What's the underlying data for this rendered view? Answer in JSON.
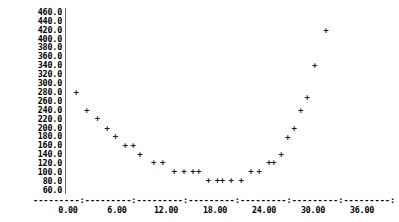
{
  "chart_data": {
    "type": "scatter",
    "title": "",
    "subtitle": "",
    "xlabel": "",
    "ylabel": "",
    "xlim": [
      -1.5,
      37.5
    ],
    "ylim": [
      55.0,
      465.0
    ],
    "grid": false,
    "legend": null,
    "marker": "+",
    "marker_color": "#1a1a1a",
    "y_ticks": [
      460.0,
      440.0,
      420.0,
      400.0,
      380.0,
      360.0,
      340.0,
      320.0,
      300.0,
      280.0,
      260.0,
      240.0,
      220.0,
      200.0,
      180.0,
      160.0,
      140.0,
      120.0,
      100.0,
      80.0,
      60.0
    ],
    "y_tick_labels": [
      "460.0",
      "440.0",
      "420.0",
      "400.0",
      "380.0",
      "360.0",
      "340.0",
      "320.0",
      "300.0",
      "280.0",
      "260.0",
      "240.0",
      "220.0",
      "200.0",
      "180.0",
      "160.0",
      "140.0",
      "120.0",
      "100.0",
      "80.0",
      "60.0"
    ],
    "x_ticks": [
      0.0,
      6.0,
      12.0,
      18.0,
      24.0,
      30.0,
      36.0
    ],
    "x_tick_labels": [
      "0.00",
      "6.00",
      "12.00",
      "18.00",
      "24.00",
      "30.00",
      "36.00"
    ],
    "axis_dash_line": "---------:---------:---------:---------:---------:---------:---------:",
    "points": [
      {
        "x": 1.0,
        "y": 280.0
      },
      {
        "x": 2.3,
        "y": 240.0
      },
      {
        "x": 3.6,
        "y": 222.0
      },
      {
        "x": 4.8,
        "y": 200.0
      },
      {
        "x": 5.8,
        "y": 182.0
      },
      {
        "x": 7.0,
        "y": 162.0
      },
      {
        "x": 8.0,
        "y": 162.0
      },
      {
        "x": 8.8,
        "y": 142.0
      },
      {
        "x": 10.5,
        "y": 122.0
      },
      {
        "x": 11.6,
        "y": 122.0
      },
      {
        "x": 13.0,
        "y": 102.0
      },
      {
        "x": 14.2,
        "y": 102.0
      },
      {
        "x": 15.3,
        "y": 102.0
      },
      {
        "x": 16.0,
        "y": 102.0
      },
      {
        "x": 17.2,
        "y": 82.0
      },
      {
        "x": 18.3,
        "y": 82.0
      },
      {
        "x": 18.9,
        "y": 82.0
      },
      {
        "x": 20.0,
        "y": 82.0
      },
      {
        "x": 21.2,
        "y": 82.0
      },
      {
        "x": 22.4,
        "y": 102.0
      },
      {
        "x": 23.4,
        "y": 102.0
      },
      {
        "x": 24.6,
        "y": 122.0
      },
      {
        "x": 25.2,
        "y": 122.0
      },
      {
        "x": 26.1,
        "y": 142.0
      },
      {
        "x": 26.9,
        "y": 180.0
      },
      {
        "x": 27.7,
        "y": 200.0
      },
      {
        "x": 28.5,
        "y": 240.0
      },
      {
        "x": 29.3,
        "y": 268.0
      },
      {
        "x": 30.2,
        "y": 340.0
      },
      {
        "x": 31.6,
        "y": 420.0
      }
    ]
  }
}
